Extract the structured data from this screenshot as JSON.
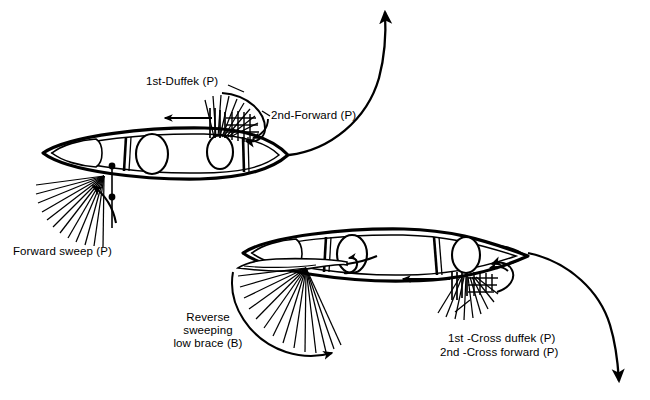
{
  "diagram": {
    "type": "line-drawing",
    "background_color": "#ffffff",
    "ink_color": "#000000",
    "labels": {
      "first_duffek": "1st-Duffek (P)",
      "second_forward": "2nd-Forward (P)",
      "forward_sweep": "Forward sweep (P)",
      "reverse_sweep_line1": "Reverse",
      "reverse_sweep_line2": "sweeping",
      "reverse_sweep_line3": "low brace (B)",
      "first_cross_duffek": "1st -Cross duffek (P)",
      "second_cross_forward": "2nd -Cross forward (P)"
    },
    "icons": {
      "canoe_top": "canoe-hull-icon",
      "canoe_bottom": "canoe-hull-icon",
      "stroke_fan": "paddle-stroke-fan-icon",
      "trajectory": "curved-trajectory-arrow-icon",
      "paddle_blade": "paddle-blade-icon",
      "leader_line": "leader-line-icon"
    },
    "canoes": [
      {
        "name": "upper-canoe",
        "bow_direction": "right",
        "seats": 2,
        "bow_shaded": true,
        "bounds": [
          40,
          128,
          290,
          180
        ]
      },
      {
        "name": "lower-canoe",
        "bow_direction": "right",
        "seats": 2,
        "bow_shaded": true,
        "bounds": [
          240,
          225,
          530,
          288
        ]
      }
    ],
    "strokes": [
      {
        "name": "forward-sweep",
        "side": "port",
        "canoe": "upper-canoe",
        "arrow": "counterclockwise"
      },
      {
        "name": "first-duffek",
        "side": "port",
        "canoe": "upper-canoe",
        "arrow": "clockwise"
      },
      {
        "name": "second-forward",
        "side": "port",
        "canoe": "upper-canoe",
        "arrow": "clockwise"
      },
      {
        "name": "reverse-sweeping-low-brace",
        "side": "bow",
        "canoe": "lower-canoe",
        "arrow": "clockwise"
      },
      {
        "name": "first-cross-duffek",
        "side": "port",
        "canoe": "lower-canoe",
        "arrow": "counterclockwise"
      },
      {
        "name": "second-cross-forward",
        "side": "port",
        "canoe": "lower-canoe",
        "arrow": "counterclockwise"
      }
    ]
  }
}
